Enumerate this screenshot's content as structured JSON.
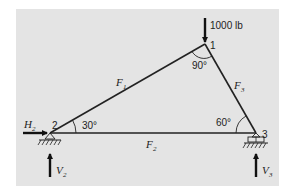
{
  "diagram": {
    "type": "truss",
    "colors": {
      "background": "#e4e4e4",
      "lines": "#222222"
    },
    "load": {
      "label": "1000 lb",
      "node": "1",
      "direction": "down"
    },
    "nodes": [
      {
        "id": "1",
        "label": "1",
        "angle": "90°"
      },
      {
        "id": "2",
        "label": "2",
        "angle": "30°",
        "support": "pin"
      },
      {
        "id": "3",
        "label": "3",
        "angle": "60°",
        "support": "roller"
      }
    ],
    "members": [
      {
        "id": "F1",
        "symbol": "F",
        "subscript": "1",
        "from": "2",
        "to": "1"
      },
      {
        "id": "F2",
        "symbol": "F",
        "subscript": "2",
        "from": "2",
        "to": "3"
      },
      {
        "id": "F3",
        "symbol": "F",
        "subscript": "3",
        "from": "1",
        "to": "3"
      }
    ],
    "reactions": [
      {
        "id": "H2",
        "symbol": "H",
        "subscript": "2",
        "direction": "right"
      },
      {
        "id": "V2",
        "symbol": "V",
        "subscript": "2",
        "direction": "up"
      },
      {
        "id": "V3",
        "symbol": "V",
        "subscript": "3",
        "direction": "up"
      }
    ]
  }
}
